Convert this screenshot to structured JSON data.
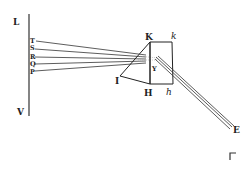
{
  "diagram": {
    "title": "",
    "wall_labels": {
      "top": "L",
      "bottom": "V"
    },
    "ray_labels": [
      "T",
      "S",
      "R",
      "Q",
      "P"
    ],
    "prism_labels": {
      "K": "K",
      "k": "k",
      "Y": "Y",
      "I": "I",
      "H": "H",
      "h": "h"
    },
    "beam_end_label": "E",
    "colors": {
      "ink": "#222222",
      "background": "#ffffff"
    }
  }
}
